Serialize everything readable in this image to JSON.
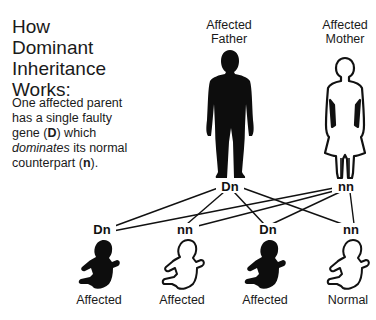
{
  "title": {
    "line1": "How",
    "line2": "Dominant",
    "line3": "Inheritance",
    "line4": "Works:"
  },
  "description": {
    "part1": "One affected parent has a single faulty gene (",
    "dominant_symbol": "D",
    "part2": ") which ",
    "emphasis": "dominates",
    "part3": " its normal counterpart (",
    "recessive_symbol": "n",
    "part4": ")."
  },
  "parents": [
    {
      "label_line1": "Affected",
      "label_line2": "Father",
      "genotype": "Dn",
      "affected": true,
      "icon": "man-silhouette-icon"
    },
    {
      "label_line1": "Affected",
      "label_line2": "Mother",
      "genotype": "nn",
      "affected": false,
      "icon": "woman-outline-icon"
    }
  ],
  "children": [
    {
      "genotype": "Dn",
      "label": "Affected",
      "affected": true,
      "icon": "baby-silhouette-icon"
    },
    {
      "genotype": "nn",
      "label": "Affected",
      "affected": false,
      "icon": "baby-outline-icon"
    },
    {
      "genotype": "Dn",
      "label": "Affected",
      "affected": true,
      "icon": "baby-silhouette-icon"
    },
    {
      "genotype": "nn",
      "label": "Normal",
      "affected": false,
      "icon": "baby-outline-icon"
    }
  ],
  "colors": {
    "affected_fill": "#0d0d0d",
    "unaffected_fill": "#ffffff",
    "line": "#111111"
  }
}
